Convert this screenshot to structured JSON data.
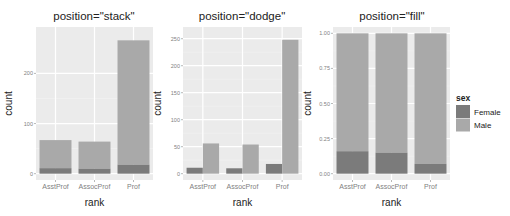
{
  "colors": {
    "panel_bg": "#ebebeb",
    "grid_major": "#ffffff",
    "grid_minor": "#f4f4f4",
    "Female": "#7b7b7b",
    "Male": "#a9a9a9",
    "tick_mark": "#8a8a8a"
  },
  "legend": {
    "title": "sex",
    "entries": [
      {
        "label": "Female",
        "color_key": "Female"
      },
      {
        "label": "Male",
        "color_key": "Male"
      }
    ]
  },
  "chart_data": [
    {
      "type": "bar",
      "title": "position=\"stack\"",
      "position": "stack",
      "xlabel": "rank",
      "ylabel": "count",
      "categories": [
        "AsstProf",
        "AssocProf",
        "Prof"
      ],
      "series": [
        {
          "name": "Female",
          "values": [
            11,
            10,
            18
          ]
        },
        {
          "name": "Male",
          "values": [
            56,
            54,
            248
          ]
        }
      ],
      "ylim": [
        0,
        280
      ],
      "yticks": [
        0,
        100,
        200
      ],
      "ytick_labels": [
        "0",
        "100",
        "200"
      ],
      "grid": true
    },
    {
      "type": "bar",
      "title": "position=\"dodge\"",
      "position": "dodge",
      "xlabel": "rank",
      "ylabel": "count",
      "categories": [
        "AsstProf",
        "AssocProf",
        "Prof"
      ],
      "series": [
        {
          "name": "Female",
          "values": [
            11,
            10,
            18
          ]
        },
        {
          "name": "Male",
          "values": [
            56,
            54,
            248
          ]
        }
      ],
      "ylim": [
        0,
        260
      ],
      "yticks": [
        0,
        50,
        100,
        150,
        200,
        250
      ],
      "ytick_labels": [
        "0",
        "50",
        "100",
        "150",
        "200",
        "250"
      ],
      "grid": true
    },
    {
      "type": "bar",
      "title": "position=\"fill\"",
      "position": "fill",
      "xlabel": "rank",
      "ylabel": "count",
      "categories": [
        "AsstProf",
        "AssocProf",
        "Prof"
      ],
      "series": [
        {
          "name": "Female",
          "values": [
            0.16,
            0.15,
            0.07
          ]
        },
        {
          "name": "Male",
          "values": [
            0.84,
            0.85,
            0.93
          ]
        }
      ],
      "ylim": [
        0,
        1
      ],
      "yticks": [
        0,
        0.25,
        0.5,
        0.75,
        1.0
      ],
      "ytick_labels": [
        "0.00",
        "0.25",
        "0.50",
        "0.75",
        "1.00"
      ],
      "grid": true
    }
  ]
}
